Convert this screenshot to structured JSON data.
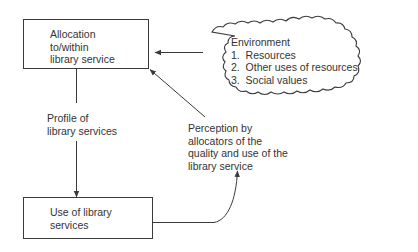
{
  "diagram": {
    "nodes": {
      "allocation": {
        "lines": [
          "Allocation",
          "to/within",
          "library service"
        ]
      },
      "use": {
        "lines": [
          "Use of library",
          "services"
        ]
      },
      "environment": {
        "title": "Environment",
        "items": [
          "1.  Resources",
          "2.  Other uses of resources",
          "3.  Social values"
        ]
      }
    },
    "edge_labels": {
      "profile": [
        "Profile of",
        "library services"
      ],
      "perception": [
        "Perception by",
        "allocators of the",
        "quality and use of the",
        "library service"
      ]
    },
    "edges": [
      {
        "from": "allocation",
        "to": "use",
        "label": "profile"
      },
      {
        "from": "environment",
        "to": "allocation",
        "label": ""
      },
      {
        "from": "use",
        "to": "perception",
        "label": ""
      },
      {
        "from": "perception",
        "to": "allocation",
        "label": ""
      }
    ],
    "colors": {
      "stroke": "#3a3a3a",
      "text": "#333333",
      "background": "#ffffff"
    }
  }
}
